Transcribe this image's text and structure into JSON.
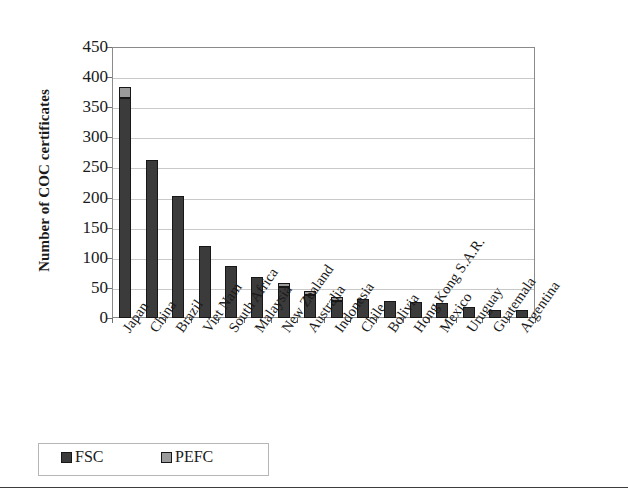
{
  "chart_data": {
    "type": "bar",
    "subtype": "stacked-bar",
    "title": "",
    "xlabel": "",
    "ylabel": "Number of COC certificates",
    "ylim": [
      0,
      450
    ],
    "ytick_step": 50,
    "yticks": [
      "450",
      "400",
      "350",
      "300",
      "250",
      "200",
      "150",
      "100",
      "50",
      "0"
    ],
    "grid": true,
    "legend_position": "bottom-left",
    "categories": [
      "Japan",
      "China",
      "Brazil",
      "Viet Nam",
      "South Africa",
      "Malaysia",
      "New Zealand",
      "Australia",
      "Indonesia",
      "Chile",
      "Bolivia",
      "Hong Kong S.A.R.",
      "Mexico",
      "Uruguay",
      "Guatemala",
      "Argentina"
    ],
    "series": [
      {
        "name": "FSC",
        "color": "#3b3b3b",
        "values": [
          365,
          262,
          203,
          119,
          87,
          68,
          51,
          38,
          29,
          31,
          29,
          27,
          25,
          19,
          13,
          13
        ]
      },
      {
        "name": "PEFC",
        "color": "#9b9b9b",
        "values": [
          18,
          0,
          0,
          0,
          0,
          0,
          1,
          3,
          6,
          0,
          0,
          0,
          0,
          0,
          0,
          0
        ]
      }
    ],
    "totals": [
      383,
      262,
      203,
      119,
      87,
      68,
      52,
      41,
      35,
      31,
      29,
      27,
      25,
      19,
      13,
      13
    ]
  },
  "legend": {
    "items": [
      {
        "label": "FSC",
        "color": "#3b3b3b"
      },
      {
        "label": "PEFC",
        "color": "#9b9b9b"
      }
    ]
  }
}
